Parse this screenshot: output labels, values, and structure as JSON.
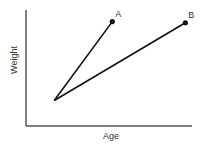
{
  "chart_data": {
    "type": "line",
    "title": "",
    "xlabel": "Age",
    "ylabel": "Weight",
    "xlim": [
      0,
      10
    ],
    "ylim": [
      0,
      10
    ],
    "grid": false,
    "legend": "none",
    "series": [
      {
        "name": "A",
        "points": [
          [
            1.7,
            2.2
          ],
          [
            5.2,
            9.0
          ]
        ],
        "label": "A",
        "color": "#111111"
      },
      {
        "name": "B",
        "points": [
          [
            1.7,
            2.2
          ],
          [
            9.6,
            8.9
          ]
        ],
        "label": "B",
        "color": "#111111"
      }
    ],
    "axis_color": "#555555"
  }
}
